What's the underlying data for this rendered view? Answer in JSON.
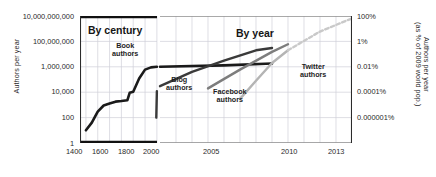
{
  "chart_data": {
    "type": "line",
    "title": "",
    "panels": [
      {
        "name": "By century",
        "title": "By century",
        "xlabel": "",
        "xlim": [
          1350,
          2001
        ],
        "xticks": [
          1400,
          1600,
          1800,
          2000
        ]
      },
      {
        "name": "By year",
        "title": "By year",
        "xlabel": "",
        "xlim": [
          2001,
          2013
        ],
        "xticks": [
          2005,
          2010,
          2013
        ]
      }
    ],
    "ylabel": "Authors per year",
    "ylabel_right": "Authors per year (as % of 2009 world pop.)",
    "yscale": "log",
    "ylim": [
      1,
      10000000000
    ],
    "yticks": [
      1,
      100,
      10000,
      1000000,
      100000000,
      10000000000
    ],
    "yticklabels": [
      "1",
      "100",
      "10,000",
      "1,000,000",
      "100,000,000",
      "10,000,000,000"
    ],
    "yticks_right": [
      "0.000001%",
      "0.0001%",
      "0.01%",
      "1%",
      "100%"
    ],
    "yticks_right_values": [
      100,
      10000,
      1000000,
      100000000,
      10000000000
    ],
    "grid": true,
    "legend": "inline-labels",
    "series": [
      {
        "name": "Book authors",
        "label": "Book authors",
        "color": "#1a1a1a",
        "width": 2.6,
        "dashed": false,
        "panel": "By century",
        "points": [
          [
            1400,
            10
          ],
          [
            1450,
            40
          ],
          [
            1500,
            300
          ],
          [
            1550,
            900
          ],
          [
            1600,
            1300
          ],
          [
            1650,
            1800
          ],
          [
            1700,
            2000
          ],
          [
            1750,
            2300
          ],
          [
            1770,
            9000
          ],
          [
            1800,
            11000
          ],
          [
            1850,
            120000
          ],
          [
            1900,
            600000
          ],
          [
            1950,
            900000
          ],
          [
            2000,
            1000000
          ]
        ]
      },
      {
        "name": "Book authors continued",
        "label": "",
        "color": "#1a1a1a",
        "width": 2.6,
        "dashed": false,
        "panel": "By year",
        "points": [
          [
            2001,
            1000000
          ],
          [
            2005,
            1300000
          ],
          [
            2008,
            1800000
          ]
        ]
      },
      {
        "name": "Blog authors",
        "label": "Blog authors",
        "color": "#3a3a3a",
        "width": 2.4,
        "dashed": false,
        "panel": "By century",
        "points": [
          [
            1995,
            100
          ],
          [
            2000,
            12000
          ]
        ]
      },
      {
        "name": "Blog authors continued",
        "label": "",
        "color": "#3a3a3a",
        "width": 2.4,
        "dashed": false,
        "panel": "By year",
        "points": [
          [
            2001,
            30000
          ],
          [
            2003,
            400000
          ],
          [
            2005,
            3000000
          ],
          [
            2007,
            20000000
          ],
          [
            2008,
            30000000
          ]
        ]
      },
      {
        "name": "Facebook authors",
        "label": "Facebook authors",
        "color": "#7d7d7d",
        "width": 2.4,
        "dashed": false,
        "panel": "By year",
        "points": [
          [
            2004,
            20000
          ],
          [
            2006,
            600000
          ],
          [
            2008,
            15000000
          ],
          [
            2009,
            60000000
          ]
        ]
      },
      {
        "name": "Twitter authors",
        "label": "Twitter authors",
        "color": "#b4b4b4",
        "width": 2.4,
        "dashed": false,
        "panel": "By year",
        "points": [
          [
            2006,
            3000
          ],
          [
            2007,
            80000
          ],
          [
            2008,
            2000000
          ],
          [
            2009,
            20000000
          ]
        ]
      },
      {
        "name": "Twitter authors projection",
        "label": "",
        "color": "#c9c9c9",
        "width": 2.4,
        "dashed": true,
        "panel": "By year",
        "points": [
          [
            2009,
            20000000
          ],
          [
            2011,
            600000000
          ],
          [
            2013,
            6500000000
          ]
        ]
      }
    ]
  },
  "axes": {
    "y_left_title": "Authors per year",
    "y_right_title_line1": "Authors per year",
    "y_right_title_line2": "(as % of 2009 world pop.)",
    "y_left_ticks": [
      "10,000,000,000",
      "100,000,000",
      "1,000,000",
      "10,000",
      "100",
      "1"
    ],
    "y_right_ticks": [
      "100%",
      "1%",
      "0.01%",
      "0.0001%",
      "0.000001%"
    ],
    "x_ticks_century": [
      "1400",
      "1600",
      "1800",
      "2000"
    ],
    "x_ticks_year": [
      "2005",
      "2010",
      "2013"
    ]
  },
  "panels": {
    "century_title": "By century",
    "year_title": "By year"
  },
  "labels": {
    "book": "Book\nauthors",
    "book_l1": "Book",
    "book_l2": "authors",
    "blog_l1": "Blog",
    "blog_l2": "authors",
    "facebook_l1": "Facebook",
    "facebook_l2": "authors",
    "twitter_l1": "Twitter",
    "twitter_l2": "authors"
  },
  "colors": {
    "book": "#1a1a1a",
    "blog": "#3a3a3a",
    "facebook": "#7d7d7d",
    "twitter": "#b4b4b4",
    "grid": "#d0d0d8",
    "axis": "#2b2b2b"
  }
}
